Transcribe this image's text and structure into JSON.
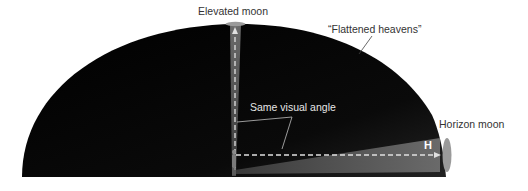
{
  "diagram": {
    "labels": {
      "elevated_moon": "Elevated moon",
      "flattened_heavens": "“Flattened heavens”",
      "same_visual_angle": "Same visual angle",
      "horizon_moon": "Horizon moon",
      "horizon_marker": "H"
    },
    "colors": {
      "sky_dome": "#050505",
      "beam": "#5a5a5a",
      "moon": "#9a9a9a",
      "dashed_line": "#e0e0e0",
      "label_dark": "#333333",
      "label_light": "#e6e6e6"
    }
  }
}
